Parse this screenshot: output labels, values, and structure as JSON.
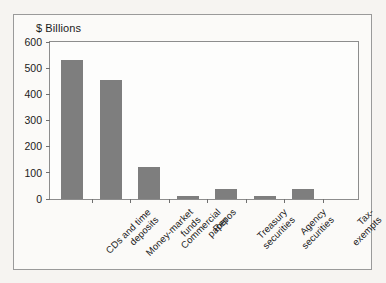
{
  "chart_data": {
    "type": "bar",
    "title": "",
    "subtitle": "",
    "xlabel": "",
    "ylabel": "$ Billions",
    "ylim": [
      0,
      600
    ],
    "yticks": [
      0,
      100,
      200,
      300,
      400,
      500,
      600
    ],
    "ytick_labels": [
      "0",
      "100",
      "200",
      "300",
      "400",
      "500",
      "600"
    ],
    "grid": false,
    "legend": false,
    "legend_position": "none",
    "bar_color": "#7e7e7e",
    "categories": [
      "CDs and time\ndeposits",
      "Money-market\nfunds",
      "Commercial\npaper",
      "Repos",
      "Treasury\nsecurities",
      "Agency\nsecurities",
      "Tax-exempts"
    ],
    "values": [
      533,
      453,
      123,
      13,
      37,
      13,
      37
    ]
  },
  "colors": {
    "page_background": "#f6f4f1",
    "figure_background": "#fbfaf8",
    "plot_background": "#fdfdfc",
    "bar": "#7e7e7e",
    "axis_line": "#8d8d8d",
    "frame_border": "#9a9a9a",
    "text": "#1b1b1b"
  }
}
